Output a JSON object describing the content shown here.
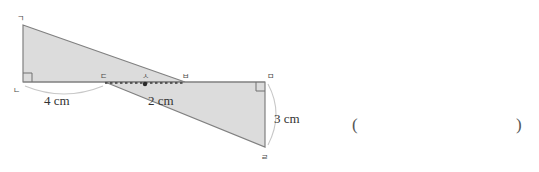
{
  "figure": {
    "fill_color": "#dcdcdc",
    "stroke_color": "#808080",
    "arc_color": "#c8c8c8",
    "vertices": [
      {
        "name": "ㄱ",
        "label": "ㄱ",
        "x": 23,
        "y": 25,
        "label_x": 17,
        "label_y": 20
      },
      {
        "name": "ㄴ",
        "label": "ㄴ",
        "x": 23,
        "y": 82,
        "label_x": 13,
        "label_y": 93
      },
      {
        "name": "ㄷ",
        "label": "ㄷ",
        "x": 105,
        "y": 82,
        "label_x": 100,
        "label_y": 78
      },
      {
        "name": "ㄹ",
        "label": "ㄹ",
        "x": 265,
        "y": 147,
        "label_x": 262,
        "label_y": 160
      },
      {
        "name": "ㅁ",
        "label": "ㅁ",
        "x": 265,
        "y": 82,
        "label_x": 268,
        "label_y": 78
      },
      {
        "name": "ㅂ",
        "label": "ㅂ",
        "x": 185,
        "y": 82,
        "label_x": 184,
        "label_y": 78
      },
      {
        "name": "ㅅ",
        "label": "ㅅ",
        "x": 145,
        "y": 84,
        "label_x": 142,
        "label_y": 78
      }
    ],
    "left_triangle_points": "23,25 185,82 23,82",
    "right_quad_points": "105,82 265,82 265,147 105,82",
    "right_shape_points": "105,82 265,82 265,147",
    "dashed_segment": {
      "x1": 105,
      "y1": 83,
      "x2": 185,
      "y2": 83
    },
    "midpoint_dot": {
      "cx": 145,
      "cy": 84,
      "r": 2
    },
    "dimensions": [
      {
        "name": "base-left",
        "text": "4 cm",
        "x": 44,
        "y": 104
      },
      {
        "name": "base-middle",
        "text": "2 cm",
        "x": 148,
        "y": 104
      },
      {
        "name": "height-right",
        "text": "3 cm",
        "x": 275,
        "y": 122
      }
    ],
    "answer_parens": {
      "open": "(",
      "close": ")",
      "open_x": 352,
      "close_x": 518,
      "y": 130
    }
  }
}
